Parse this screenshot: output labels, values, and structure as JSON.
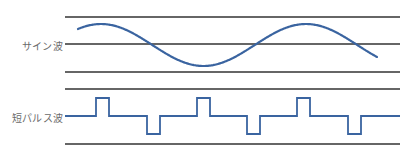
{
  "colors": {
    "wave": "#3a64a0",
    "line": "#333333",
    "label": "#6a6a6a",
    "background": "#ffffff"
  },
  "panels": [
    {
      "id": "sine",
      "label": "サイン波",
      "label_pos": {
        "x": 22,
        "y": 38
      },
      "lines_y": [
        17,
        44,
        72
      ],
      "line_x": [
        65,
        400
      ],
      "wave": {
        "type": "sine",
        "x_start": 78,
        "x_end": 377,
        "center_y": 45,
        "amplitude": 21,
        "period": 205,
        "peak_x": 101
      }
    },
    {
      "id": "pulse",
      "label": "短パルス波",
      "label_pos": {
        "x": 12,
        "y": 110
      },
      "lines_y": [
        89,
        144
      ],
      "line_x": [
        65,
        400
      ],
      "wave": {
        "type": "pulse",
        "baseline_y": 116,
        "x_start": 65,
        "x_end": 400,
        "pulse_height": 18,
        "pulse_width": 13,
        "pulses": [
          {
            "x": 96,
            "dir": "up"
          },
          {
            "x": 147,
            "dir": "down"
          },
          {
            "x": 197,
            "dir": "up"
          },
          {
            "x": 247,
            "dir": "down"
          },
          {
            "x": 297,
            "dir": "up"
          },
          {
            "x": 348,
            "dir": "down"
          }
        ]
      }
    }
  ]
}
